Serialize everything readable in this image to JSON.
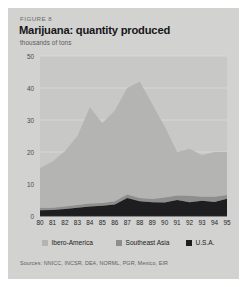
{
  "figure": {
    "label": "FIGURE 8",
    "title": "Marijuana: quantity produced",
    "subtitle": "thousands of tons",
    "sources": "Sources: NNICC, INCSR, DEA, NORML, PGR, Mexico, EIR"
  },
  "colors": {
    "panel_background": "#d2d2d0",
    "plot_background": "#c8c8c6",
    "ibero_america": "#b4b4b2",
    "southeast_asia": "#8e8e8c",
    "usa": "#1e1e20",
    "gridline": "#dcdcda",
    "axis_text": "#26262a"
  },
  "legend": {
    "position": "bottom",
    "items": [
      {
        "label": "Ibero-America",
        "color": "#b4b4b2"
      },
      {
        "label": "Southeast Asia",
        "color": "#8e8e8c"
      },
      {
        "label": "U.S.A.",
        "color": "#1e1e20"
      }
    ]
  },
  "chart_data": {
    "type": "area",
    "stacked": true,
    "title": "Marijuana: quantity produced",
    "subtitle": "thousands of tons",
    "xlabel": "",
    "ylabel": "thousands of tons",
    "ylim": [
      0,
      50
    ],
    "yticks": [
      0,
      10,
      20,
      30,
      40,
      50
    ],
    "ytick_labels": [
      "0",
      "10",
      "20",
      "30",
      "40",
      "50"
    ],
    "grid": true,
    "categories": [
      "80",
      "81",
      "82",
      "83",
      "84",
      "85",
      "86",
      "87",
      "88",
      "89",
      "90",
      "91",
      "92",
      "93",
      "94",
      "95"
    ],
    "x": [
      1980,
      1981,
      1982,
      1983,
      1984,
      1985,
      1986,
      1987,
      1988,
      1989,
      1990,
      1991,
      1992,
      1993,
      1994,
      1995
    ],
    "series": [
      {
        "name": "U.S.A.",
        "color": "#1e1e20",
        "values": [
          1.8,
          1.9,
          2.2,
          2.6,
          3.0,
          3.2,
          3.6,
          5.6,
          4.6,
          4.3,
          4.2,
          5.0,
          4.3,
          4.8,
          4.4,
          5.4
        ]
      },
      {
        "name": "Southeast Asia",
        "color": "#8e8e8c",
        "values": [
          0.7,
          0.7,
          0.8,
          0.8,
          0.9,
          0.9,
          1.0,
          1.1,
          1.0,
          1.0,
          1.6,
          1.4,
          2.0,
          1.2,
          1.6,
          1.2
        ]
      },
      {
        "name": "Ibero-America",
        "color": "#b4b4b2",
        "values": [
          12.5,
          14.4,
          17.2,
          21.6,
          30.1,
          24.9,
          28.4,
          33.3,
          36.4,
          29.7,
          22.2,
          13.6,
          14.7,
          13.0,
          14.0,
          13.4
        ]
      }
    ],
    "totals": [
      15.0,
      17.0,
      20.2,
      25.0,
      34.0,
      29.0,
      33.0,
      40.0,
      42.0,
      35.0,
      28.0,
      20.0,
      21.0,
      19.0,
      20.0,
      20.0
    ]
  }
}
